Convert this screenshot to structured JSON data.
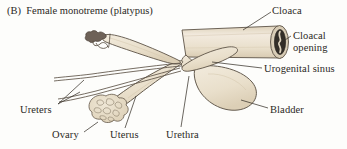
{
  "figure": {
    "panel_label": "(B)",
    "title": "Female monotreme (platypus)",
    "title_full": "(B)  Female monotreme (platypus)"
  },
  "colors": {
    "background": "#fdfdfb",
    "organ_fill": "#e9decb",
    "organ_fill_light": "#f0e8d8",
    "organ_fill_shadow": "#ddd0b8",
    "outline": "#5d5347",
    "text": "#2b2824",
    "leader_line": "#3a342c",
    "cloacal_opening_dark": "#332e28"
  },
  "labels": [
    {
      "id": "cloaca",
      "text": "Cloaca",
      "position": "top-right"
    },
    {
      "id": "cloacal-opening",
      "text": "Cloacal\nopening",
      "line1": "Cloacal",
      "line2": "opening",
      "position": "right-upper"
    },
    {
      "id": "urogenital-sinus",
      "text": "Urogenital sinus",
      "position": "right-middle"
    },
    {
      "id": "bladder",
      "text": "Bladder",
      "position": "right-lower"
    },
    {
      "id": "ureters",
      "text": "Ureters",
      "position": "left-lower"
    },
    {
      "id": "ovary",
      "text": "Ovary",
      "position": "bottom-left"
    },
    {
      "id": "uterus",
      "text": "Uterus",
      "position": "bottom-center"
    },
    {
      "id": "urethra",
      "text": "Urethra",
      "position": "bottom-center-right"
    }
  ],
  "structures": [
    {
      "id": "cloaca",
      "name": "cloaca",
      "shape": "cylindrical-tube"
    },
    {
      "id": "cloacal-opening",
      "name": "cloacal opening",
      "shape": "elliptical-aperture"
    },
    {
      "id": "urogenital-sinus",
      "name": "urogenital sinus",
      "shape": "tapered-duct"
    },
    {
      "id": "bladder",
      "name": "bladder",
      "shape": "teardrop-sac"
    },
    {
      "id": "urethra",
      "name": "urethra",
      "shape": "narrow-duct"
    },
    {
      "id": "uterus-left",
      "name": "uterus",
      "shape": "elongated-sac"
    },
    {
      "id": "uterus-right",
      "name": "uterus",
      "shape": "elongated-sac"
    },
    {
      "id": "ovary-lower",
      "name": "ovary",
      "shape": "lobed-cluster"
    },
    {
      "id": "ovary-upper",
      "name": "ovary",
      "shape": "small-lobed-cluster"
    },
    {
      "id": "ureter-upper",
      "name": "ureter",
      "shape": "thin-tube"
    },
    {
      "id": "ureter-lower",
      "name": "ureter",
      "shape": "thin-tube"
    }
  ]
}
